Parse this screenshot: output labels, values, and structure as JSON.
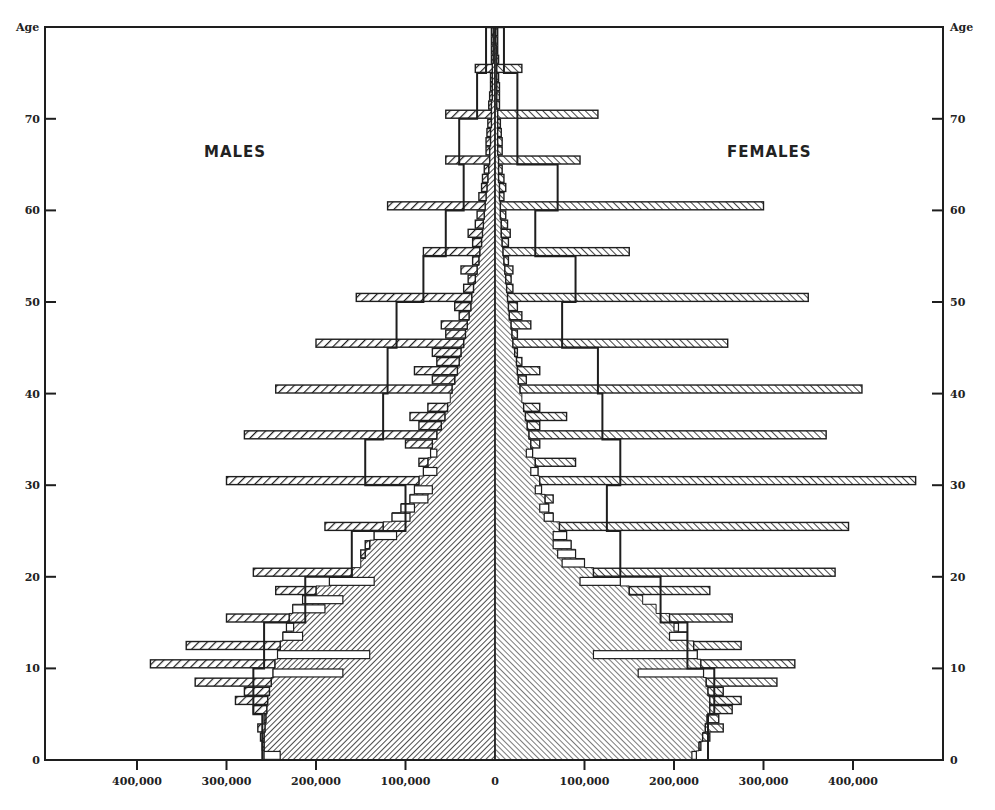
{
  "chart_data": {
    "type": "bar",
    "subtype": "population-pyramid",
    "title": "",
    "left_label": "MALES",
    "right_label": "FEMALES",
    "ylabel": "Age",
    "xlabel": "",
    "ylim": [
      0,
      80
    ],
    "y_ticks": [
      0,
      10,
      20,
      30,
      40,
      50,
      60,
      70
    ],
    "x_ticks_left": [
      "400,000",
      "300,000",
      "200,000",
      "100,000",
      "0"
    ],
    "x_ticks_right": [
      "100,000",
      "200,000",
      "300,000",
      "400,000"
    ],
    "x_tick_values": [
      0,
      100000,
      200000,
      300000,
      400000
    ],
    "unit": "thousands",
    "series": [
      {
        "name": "Males (single-year actual)",
        "side": "left",
        "ages": "0-79",
        "values": [
          240,
          260,
          262,
          265,
          258,
          270,
          290,
          280,
          335,
          170,
          385,
          140,
          345,
          215,
          225,
          300,
          190,
          170,
          245,
          135,
          270,
          150,
          150,
          145,
          110,
          190,
          95,
          90,
          75,
          70,
          300,
          65,
          85,
          65,
          100,
          280,
          85,
          95,
          75,
          50,
          245,
          70,
          90,
          65,
          70,
          200,
          55,
          60,
          40,
          45,
          155,
          35,
          30,
          38,
          25,
          80,
          25,
          30,
          22,
          20,
          120,
          18,
          15,
          14,
          12,
          55,
          10,
          10,
          9,
          8,
          55,
          7,
          6,
          5,
          5,
          22,
          4,
          4,
          4,
          4
        ]
      },
      {
        "name": "Males (smoothed base)",
        "side": "left",
        "values": [
          258,
          258,
          258,
          257,
          256,
          255,
          254,
          252,
          250,
          248,
          246,
          243,
          240,
          237,
          233,
          230,
          226,
          215,
          200,
          185,
          160,
          150,
          145,
          140,
          135,
          125,
          115,
          105,
          95,
          90,
          85,
          80,
          75,
          72,
          70,
          65,
          60,
          56,
          53,
          50,
          48,
          45,
          42,
          40,
          38,
          35,
          33,
          31,
          29,
          27,
          26,
          24,
          22,
          20,
          18,
          17,
          15,
          14,
          13,
          12,
          11,
          10,
          9,
          8,
          7,
          6,
          6,
          5,
          5,
          4,
          4,
          4,
          3,
          3,
          3,
          3,
          2,
          2,
          2,
          2
        ]
      },
      {
        "name": "Males (5-year average)",
        "side": "left",
        "groups": [
          "0-4",
          "5-9",
          "10-14",
          "15-19",
          "20-24",
          "25-29",
          "30-34",
          "35-39",
          "40-44",
          "45-49",
          "50-54",
          "55-59",
          "60-64",
          "65-69",
          "70-74",
          "75-79"
        ],
        "values": [
          260,
          270,
          258,
          212,
          160,
          100,
          145,
          125,
          120,
          110,
          80,
          55,
          35,
          40,
          20,
          10
        ]
      },
      {
        "name": "Females (single-year actual)",
        "side": "right",
        "ages": "0-79",
        "values": [
          220,
          230,
          240,
          255,
          250,
          265,
          275,
          255,
          315,
          160,
          335,
          110,
          275,
          195,
          200,
          265,
          180,
          165,
          240,
          95,
          380,
          75,
          70,
          65,
          65,
          395,
          55,
          50,
          65,
          45,
          470,
          40,
          90,
          35,
          50,
          370,
          50,
          80,
          50,
          30,
          410,
          35,
          50,
          30,
          25,
          260,
          25,
          40,
          30,
          25,
          350,
          20,
          18,
          20,
          15,
          150,
          15,
          17,
          14,
          12,
          300,
          10,
          12,
          10,
          8,
          95,
          8,
          8,
          7,
          6,
          115,
          5,
          5,
          5,
          4,
          30,
          4,
          3,
          3,
          3
        ]
      },
      {
        "name": "Females (smoothed base)",
        "side": "right",
        "values": [
          225,
          228,
          232,
          235,
          237,
          240,
          240,
          238,
          236,
          233,
          230,
          226,
          222,
          215,
          205,
          195,
          180,
          165,
          150,
          140,
          110,
          100,
          90,
          85,
          80,
          72,
          65,
          60,
          56,
          52,
          50,
          48,
          45,
          42,
          40,
          38,
          36,
          34,
          32,
          30,
          28,
          26,
          25,
          24,
          22,
          20,
          19,
          18,
          16,
          15,
          14,
          13,
          12,
          11,
          10,
          9,
          8,
          7,
          7,
          6,
          6,
          5,
          5,
          4,
          4,
          4,
          3,
          3,
          3,
          3,
          3,
          2,
          2,
          2,
          2,
          2,
          2,
          2,
          1,
          1
        ]
      },
      {
        "name": "Females (5-year average)",
        "side": "right",
        "groups": [
          "0-4",
          "5-9",
          "10-14",
          "15-19",
          "20-24",
          "25-29",
          "30-34",
          "35-39",
          "40-44",
          "45-49",
          "50-54",
          "55-59",
          "60-64",
          "65-69",
          "70-74",
          "75-79"
        ],
        "values": [
          238,
          245,
          215,
          185,
          140,
          125,
          140,
          120,
          115,
          75,
          90,
          45,
          70,
          25,
          25,
          10
        ]
      }
    ]
  },
  "colors": {
    "ink": "#1e1e1e",
    "background": "#ffffff"
  }
}
